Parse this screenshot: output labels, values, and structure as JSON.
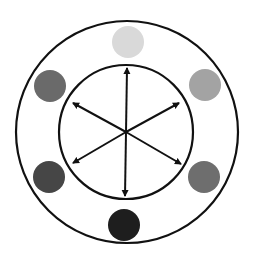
{
  "diagram": {
    "center": {
      "x": 127,
      "y": 132
    },
    "outer_ring": {
      "r": 111,
      "stroke": "#111111",
      "stroke_width": 2.2
    },
    "inner_ring": {
      "r": 67,
      "stroke": "#111111",
      "stroke_width": 2.2
    },
    "arrow_color": "#111111",
    "arrow_length": 62,
    "circle_radius": 16,
    "nodes": [
      {
        "id": "top",
        "angle_deg": -90,
        "x": 128,
        "y": 42,
        "color": "#d9d9d9"
      },
      {
        "id": "upper-right",
        "angle_deg": -30,
        "x": 205,
        "y": 85,
        "color": "#a3a3a3"
      },
      {
        "id": "lower-right",
        "angle_deg": 30,
        "x": 204,
        "y": 177,
        "color": "#6e6e6e"
      },
      {
        "id": "bottom",
        "angle_deg": 90,
        "x": 124,
        "y": 225,
        "color": "#1e1e1e"
      },
      {
        "id": "lower-left",
        "angle_deg": 150,
        "x": 49,
        "y": 177,
        "color": "#464646"
      },
      {
        "id": "upper-left",
        "angle_deg": 210,
        "x": 50,
        "y": 86,
        "color": "#6a6a6a"
      }
    ],
    "arrows": [
      {
        "id": "arrow-up",
        "x2": 127,
        "y2": 68
      },
      {
        "id": "arrow-down",
        "x2": 125,
        "y2": 196
      },
      {
        "id": "arrow-upper-right",
        "x2": 179,
        "y2": 103
      },
      {
        "id": "arrow-lower-right",
        "x2": 181,
        "y2": 164
      },
      {
        "id": "arrow-upper-left",
        "x2": 73,
        "y2": 103
      },
      {
        "id": "arrow-lower-left",
        "x2": 73,
        "y2": 163
      }
    ]
  }
}
